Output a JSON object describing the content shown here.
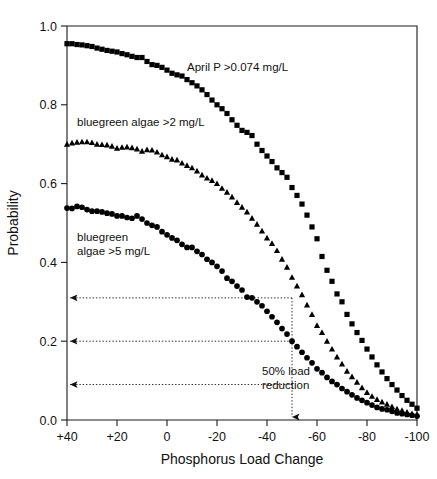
{
  "chart_data": {
    "type": "scatter",
    "title": "",
    "xlabel": "Phosphorus Load Change",
    "ylabel": "Probability",
    "xlim": [
      40,
      -100
    ],
    "ylim": [
      0.0,
      1.0
    ],
    "xticks": [
      40,
      20,
      0,
      -20,
      -40,
      -60,
      -80,
      -100
    ],
    "xticklabels": [
      "+40",
      "+20",
      "0",
      "-20",
      "-40",
      "-60",
      "-80",
      "-100"
    ],
    "yticks": [
      0.0,
      0.2,
      0.4,
      0.6,
      0.8,
      1.0
    ],
    "yticklabels": [
      "0.0",
      "0.2",
      "0.4",
      "0.6",
      "0.8",
      "1.0"
    ],
    "grid": false,
    "legend_position": "inline-annotations",
    "series": [
      {
        "name": "April P >0.074 mg/L",
        "marker": "square",
        "color": "#000000",
        "label_text": "April P >0.074 mg/L",
        "label_x": -8,
        "label_y": 0.885,
        "x": [
          40,
          38,
          36,
          34,
          32,
          30,
          28,
          26,
          24,
          22,
          20,
          18,
          16,
          14,
          12,
          10,
          8,
          6,
          4,
          2,
          0,
          -2,
          -4,
          -6,
          -8,
          -10,
          -12,
          -14,
          -16,
          -18,
          -20,
          -22,
          -24,
          -26,
          -28,
          -30,
          -32,
          -34,
          -36,
          -38,
          -40,
          -42,
          -44,
          -46,
          -48,
          -50,
          -52,
          -54,
          -56,
          -58,
          -60,
          -62,
          -64,
          -66,
          -68,
          -70,
          -72,
          -74,
          -76,
          -78,
          -80,
          -82,
          -84,
          -86,
          -88,
          -90,
          -92,
          -94,
          -96,
          -98,
          -100
        ],
        "y": [
          0.955,
          0.955,
          0.953,
          0.952,
          0.95,
          0.948,
          0.944,
          0.941,
          0.938,
          0.936,
          0.934,
          0.93,
          0.927,
          0.923,
          0.92,
          0.92,
          0.91,
          0.902,
          0.9,
          0.895,
          0.888,
          0.88,
          0.876,
          0.873,
          0.864,
          0.856,
          0.848,
          0.838,
          0.826,
          0.812,
          0.8,
          0.79,
          0.778,
          0.762,
          0.748,
          0.735,
          0.73,
          0.722,
          0.7,
          0.684,
          0.67,
          0.656,
          0.64,
          0.628,
          0.616,
          0.59,
          0.57,
          0.548,
          0.52,
          0.49,
          0.46,
          0.415,
          0.38,
          0.352,
          0.32,
          0.3,
          0.268,
          0.244,
          0.222,
          0.202,
          0.18,
          0.16,
          0.14,
          0.122,
          0.105,
          0.09,
          0.076,
          0.062,
          0.05,
          0.04,
          0.03
        ]
      },
      {
        "name": "bluegreen algae >2 mg/L",
        "marker": "triangle",
        "color": "#000000",
        "label_text": "bluegreen algae >2 mg/L",
        "label_x": 36,
        "label_y": 0.745,
        "x": [
          40,
          38,
          36,
          34,
          32,
          30,
          28,
          26,
          24,
          22,
          20,
          18,
          16,
          14,
          12,
          10,
          8,
          6,
          4,
          2,
          0,
          -2,
          -4,
          -6,
          -8,
          -10,
          -12,
          -14,
          -16,
          -18,
          -20,
          -22,
          -24,
          -26,
          -28,
          -30,
          -32,
          -34,
          -36,
          -38,
          -40,
          -42,
          -44,
          -46,
          -48,
          -50,
          -52,
          -54,
          -56,
          -58,
          -60,
          -62,
          -64,
          -66,
          -68,
          -70,
          -72,
          -74,
          -76,
          -78,
          -80,
          -82,
          -84,
          -86,
          -88,
          -90,
          -92,
          -94,
          -96,
          -98,
          -100
        ],
        "y": [
          0.7,
          0.703,
          0.705,
          0.706,
          0.706,
          0.704,
          0.7,
          0.699,
          0.698,
          0.695,
          0.69,
          0.692,
          0.693,
          0.691,
          0.688,
          0.682,
          0.686,
          0.685,
          0.68,
          0.673,
          0.668,
          0.662,
          0.66,
          0.652,
          0.646,
          0.64,
          0.632,
          0.622,
          0.614,
          0.608,
          0.6,
          0.588,
          0.578,
          0.566,
          0.552,
          0.54,
          0.528,
          0.512,
          0.497,
          0.48,
          0.462,
          0.448,
          0.43,
          0.408,
          0.388,
          0.362,
          0.34,
          0.318,
          0.292,
          0.268,
          0.24,
          0.222,
          0.2,
          0.18,
          0.16,
          0.142,
          0.124,
          0.11,
          0.096,
          0.082,
          0.07,
          0.06,
          0.052,
          0.046,
          0.04,
          0.034,
          0.028,
          0.024,
          0.02,
          0.016,
          0.014
        ]
      },
      {
        "name": "bluegreen algae >5 mg/L",
        "marker": "circle",
        "color": "#000000",
        "label_text_line1": "bluegreen",
        "label_text_line2": "algae >5 mg/L",
        "label_x": 36,
        "label_y": 0.455,
        "x": [
          40,
          38,
          36,
          34,
          32,
          30,
          28,
          26,
          24,
          22,
          20,
          18,
          16,
          14,
          12,
          10,
          8,
          6,
          4,
          2,
          0,
          -2,
          -4,
          -6,
          -8,
          -10,
          -12,
          -14,
          -16,
          -18,
          -20,
          -22,
          -24,
          -26,
          -28,
          -30,
          -32,
          -34,
          -36,
          -38,
          -40,
          -42,
          -44,
          -46,
          -48,
          -50,
          -52,
          -54,
          -56,
          -58,
          -60,
          -62,
          -64,
          -66,
          -68,
          -70,
          -72,
          -74,
          -76,
          -78,
          -80,
          -82,
          -84,
          -86,
          -88,
          -90,
          -92,
          -94,
          -96,
          -98,
          -100
        ],
        "y": [
          0.538,
          0.537,
          0.542,
          0.54,
          0.534,
          0.53,
          0.53,
          0.528,
          0.525,
          0.523,
          0.518,
          0.518,
          0.514,
          0.512,
          0.518,
          0.51,
          0.5,
          0.494,
          0.49,
          0.478,
          0.47,
          0.462,
          0.456,
          0.446,
          0.438,
          0.438,
          0.428,
          0.42,
          0.408,
          0.4,
          0.39,
          0.378,
          0.36,
          0.352,
          0.34,
          0.33,
          0.312,
          0.31,
          0.3,
          0.29,
          0.276,
          0.262,
          0.248,
          0.232,
          0.218,
          0.2,
          0.186,
          0.172,
          0.158,
          0.145,
          0.13,
          0.12,
          0.108,
          0.098,
          0.09,
          0.08,
          0.072,
          0.064,
          0.056,
          0.05,
          0.044,
          0.038,
          0.032,
          0.028,
          0.026,
          0.022,
          0.018,
          0.016,
          0.014,
          0.012,
          0.01
        ]
      }
    ],
    "annotations": [
      {
        "name": "load-reduction-note",
        "text_line1": "50% load",
        "text_line2": "reduction",
        "x": -38,
        "y": 0.115
      }
    ],
    "guides": {
      "vertical_x": -50,
      "vertical_y_top": 0.31,
      "horizontal_y": [
        0.31,
        0.2,
        0.09
      ]
    }
  }
}
